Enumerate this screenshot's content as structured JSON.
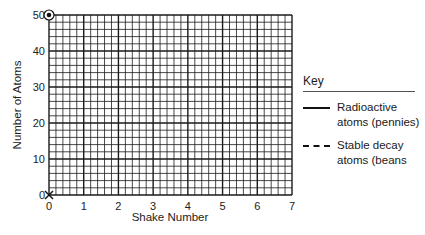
{
  "chart_data": {
    "type": "scatter",
    "title": "",
    "xlabel": "Shake Number",
    "ylabel": "Number of Atoms",
    "xlim": [
      0,
      7
    ],
    "ylim": [
      0,
      50
    ],
    "x_ticks": [
      "0",
      "1",
      "2",
      "3",
      "4",
      "5",
      "6",
      "7"
    ],
    "y_ticks": [
      "0",
      "10",
      "20",
      "30",
      "40",
      "50"
    ],
    "grid": true,
    "grid_minor_divisions_per_major": 5,
    "series": [
      {
        "name": "Radioactive atoms (pennies)",
        "style": "solid",
        "marker": "circled-dot",
        "points": [
          {
            "x": 0,
            "y": 50
          }
        ]
      },
      {
        "name": "Stable decay atoms (beans",
        "style": "dashed",
        "marker": "x",
        "points": [
          {
            "x": 0,
            "y": 0
          }
        ]
      }
    ],
    "legend_position": "right"
  },
  "legend": {
    "title": "Key",
    "items": [
      {
        "label": "Radioactive atoms (pennies)",
        "style": "solid"
      },
      {
        "label": "Stable decay atoms (beans",
        "style": "dashed"
      }
    ]
  },
  "colors": {
    "grid": "#1a1a1a",
    "text": "#222222",
    "background": "#ffffff"
  }
}
